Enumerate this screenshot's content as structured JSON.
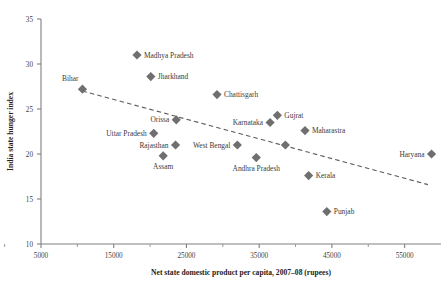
{
  "chart_data": {
    "type": "scatter",
    "title": "",
    "xlabel": "Net state domestic product per capita, 2007–08 (rupees)",
    "ylabel": "India state hunger index",
    "xlim": [
      5000,
      60000
    ],
    "ylim": [
      10,
      35
    ],
    "xticks": [
      5000,
      15000,
      25000,
      35000,
      45000,
      55000
    ],
    "xticklabels": [
      "5000",
      "15000",
      "25000",
      "35000",
      "45000",
      "55000"
    ],
    "yticks": [
      10,
      15,
      20,
      25,
      30,
      35
    ],
    "yticklabels": [
      "10",
      "15",
      "20",
      "25",
      "30",
      "35"
    ],
    "grid": false,
    "legend": null,
    "points": [
      {
        "label": "Bihar",
        "x": 10700,
        "y": 27.2,
        "label_dx": -4,
        "label_dy": -8,
        "anchor": "end"
      },
      {
        "label": "Madhya Pradesh",
        "x": 18200,
        "y": 31.0,
        "label_dx": 7,
        "label_dy": 2.5,
        "anchor": "start"
      },
      {
        "label": "Jharkhand",
        "x": 20100,
        "y": 28.6,
        "label_dx": 7,
        "label_dy": 2.5,
        "anchor": "start"
      },
      {
        "label": "Chattisgarh",
        "x": 29200,
        "y": 26.6,
        "label_dx": 7,
        "label_dy": 2.5,
        "anchor": "start"
      },
      {
        "label": "Orissa",
        "x": 23600,
        "y": 23.8,
        "label_dx": -7,
        "label_dy": 2.5,
        "anchor": "end"
      },
      {
        "label": "Karnataka",
        "x": 36500,
        "y": 23.5,
        "label_dx": -7,
        "label_dy": 2.5,
        "anchor": "end"
      },
      {
        "label": "Gujrat",
        "x": 37500,
        "y": 24.3,
        "label_dx": 7,
        "label_dy": 2.5,
        "anchor": "start"
      },
      {
        "label": "Maharastra",
        "x": 41300,
        "y": 22.6,
        "label_dx": 7,
        "label_dy": 2.5,
        "anchor": "start"
      },
      {
        "label": "Uttar Pradesh",
        "x": 20500,
        "y": 22.3,
        "label_dx": -7,
        "label_dy": 2.5,
        "anchor": "end"
      },
      {
        "label": "Rajasthan",
        "x": 23500,
        "y": 21.0,
        "label_dx": -7,
        "label_dy": 2.5,
        "anchor": "end"
      },
      {
        "label": "West Bengal",
        "x": 32000,
        "y": 21.0,
        "label_dx": -7,
        "label_dy": 2.5,
        "anchor": "end"
      },
      {
        "label": "Assam",
        "x": 21800,
        "y": 19.8,
        "label_dx": 0,
        "label_dy": 13,
        "anchor": "middle"
      },
      {
        "label": "Andhra Pradesh",
        "x": 34600,
        "y": 19.6,
        "label_dx": 0,
        "label_dy": 13,
        "anchor": "middle"
      },
      {
        "label": "",
        "x": 38600,
        "y": 21.0,
        "label_dx": 0,
        "label_dy": 0,
        "anchor": "middle"
      },
      {
        "label": "Kerala",
        "x": 41800,
        "y": 17.6,
        "label_dx": 7,
        "label_dy": 2.5,
        "anchor": "start"
      },
      {
        "label": "Punjab",
        "x": 44300,
        "y": 13.6,
        "label_dx": 7,
        "label_dy": 2.5,
        "anchor": "start"
      },
      {
        "label": "Haryana",
        "x": 58700,
        "y": 20.0,
        "label_dx": -7,
        "label_dy": 2.5,
        "anchor": "end"
      }
    ],
    "trendline": {
      "x0": 10700,
      "y0": 27.0,
      "x1": 58200,
      "y1": 16.6,
      "style": "dashed"
    }
  },
  "colors": {
    "marker": "#6f6f6f",
    "axis": "#808080",
    "trend": "#5a5a5a",
    "text": "#3a3a3a",
    "background": "#ffffff"
  }
}
